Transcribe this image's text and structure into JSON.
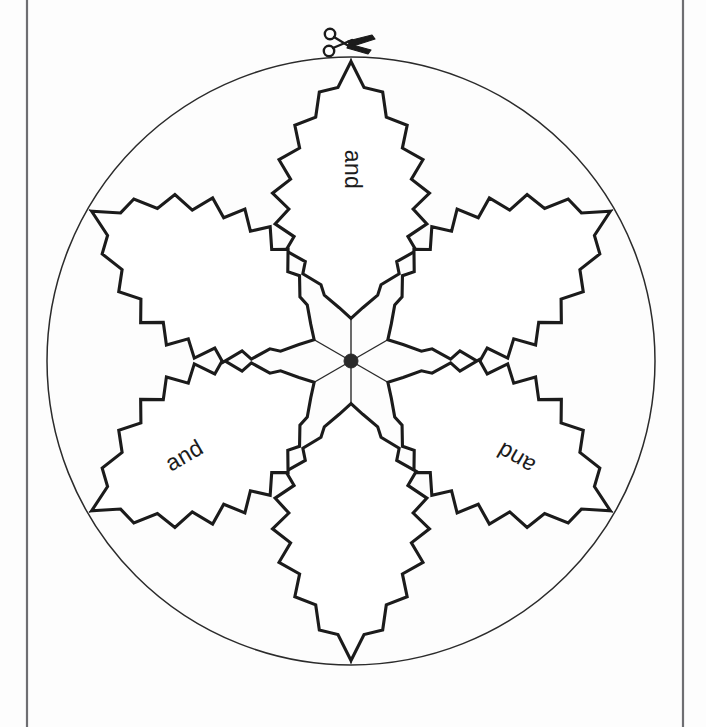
{
  "page": {
    "background_color": "#ffffff",
    "border_color": "#6e6e72",
    "ink_color": "#1b1b1b",
    "width": 706,
    "height": 727
  },
  "wheel": {
    "name": "six-petal-cutting-wheel",
    "center_x": 351,
    "center_y": 361,
    "radius": 304,
    "petal_count": 6,
    "hub_radius": 7,
    "hub_color": "#2a2a2a",
    "spoke_count": 6,
    "outline_color": "#2b2b2b",
    "petal_edge_style": "zigzag",
    "zigzag_teeth_per_side": 9
  },
  "petals": [
    {
      "id": "petal-top",
      "position": "top",
      "angle_deg": 270,
      "label": "and",
      "label_rotation_deg": 90,
      "has_label": true
    },
    {
      "id": "petal-upper-right",
      "position": "upper-right",
      "angle_deg": 330,
      "label": "",
      "label_rotation_deg": 150,
      "has_label": false
    },
    {
      "id": "petal-lower-right",
      "position": "lower-right",
      "angle_deg": 30,
      "label": "and",
      "label_rotation_deg": 210,
      "has_label": true
    },
    {
      "id": "petal-bottom",
      "position": "bottom",
      "angle_deg": 90,
      "label": "",
      "label_rotation_deg": 270,
      "has_label": false
    },
    {
      "id": "petal-lower-left",
      "position": "lower-left",
      "angle_deg": 150,
      "label": "and",
      "label_rotation_deg": 330,
      "has_label": true
    },
    {
      "id": "petal-upper-left",
      "position": "upper-left",
      "angle_deg": 210,
      "label": "",
      "label_rotation_deg": 30,
      "has_label": false
    }
  ],
  "scissors": {
    "name": "scissors-icon",
    "meaning": "cut-along-line-marker",
    "x": 345,
    "y": 45,
    "color": "#1b1b1b"
  }
}
